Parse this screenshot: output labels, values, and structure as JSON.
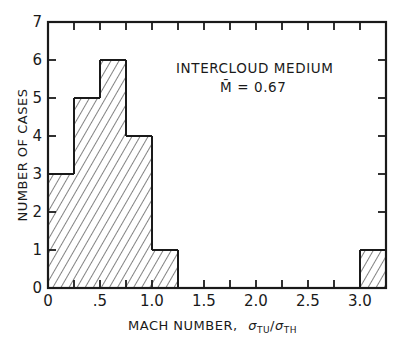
{
  "chart_data": {
    "type": "bar",
    "subtype": "histogram",
    "title": "",
    "annotations": [
      "INTERCLOUD MEDIUM",
      "M̄ = 0.67"
    ],
    "annotation_title": "INTERCLOUD MEDIUM",
    "annotation_mean": "M̄ = 0.67",
    "xlabel": "MACH NUMBER, σTU/σTH",
    "xlabel_main": "MACH NUMBER,",
    "ylabel": "NUMBER OF CASES",
    "bin_width": 0.25,
    "bins": [
      {
        "start": 0.0,
        "end": 0.25,
        "count": 3
      },
      {
        "start": 0.25,
        "end": 0.5,
        "count": 5
      },
      {
        "start": 0.5,
        "end": 0.75,
        "count": 6
      },
      {
        "start": 0.75,
        "end": 1.0,
        "count": 4
      },
      {
        "start": 1.0,
        "end": 1.25,
        "count": 1
      },
      {
        "start": 1.25,
        "end": 1.5,
        "count": 0
      },
      {
        "start": 1.5,
        "end": 1.75,
        "count": 0
      },
      {
        "start": 1.75,
        "end": 2.0,
        "count": 0
      },
      {
        "start": 2.0,
        "end": 2.25,
        "count": 0
      },
      {
        "start": 2.25,
        "end": 2.5,
        "count": 0
      },
      {
        "start": 2.5,
        "end": 2.75,
        "count": 0
      },
      {
        "start": 2.75,
        "end": 3.0,
        "count": 0
      },
      {
        "start": 3.0,
        "end": 3.25,
        "count": 1
      }
    ],
    "categories": [
      "0-0.25",
      "0.25-0.5",
      "0.5-0.75",
      "0.75-1.0",
      "1.0-1.25",
      "1.25-1.5",
      "1.5-1.75",
      "1.75-2.0",
      "2.0-2.25",
      "2.25-2.5",
      "2.5-2.75",
      "2.75-3.0",
      "3.0-3.25"
    ],
    "values": [
      3,
      5,
      6,
      4,
      1,
      0,
      0,
      0,
      0,
      0,
      0,
      0,
      1
    ],
    "xlim": [
      0,
      3.25
    ],
    "ylim": [
      0,
      7
    ],
    "xticks": [
      {
        "value": 0,
        "label": "0"
      },
      {
        "value": 0.5,
        "label": ".5"
      },
      {
        "value": 1.0,
        "label": "1.0"
      },
      {
        "value": 1.5,
        "label": "1.5"
      },
      {
        "value": 2.0,
        "label": "2.0"
      },
      {
        "value": 2.5,
        "label": "2.5"
      },
      {
        "value": 3.0,
        "label": "3.0"
      }
    ],
    "yticks": [
      {
        "value": 0,
        "label": "0"
      },
      {
        "value": 1,
        "label": "1"
      },
      {
        "value": 2,
        "label": "2"
      },
      {
        "value": 3,
        "label": "3"
      },
      {
        "value": 4,
        "label": "4"
      },
      {
        "value": 5,
        "label": "5"
      },
      {
        "value": 6,
        "label": "6"
      },
      {
        "value": 7,
        "label": "7"
      }
    ],
    "fill_pattern": "diagonal-hatch",
    "grid": false,
    "legend": null
  },
  "colors": {
    "ink": "#1a1a1a",
    "background": "#ffffff"
  }
}
